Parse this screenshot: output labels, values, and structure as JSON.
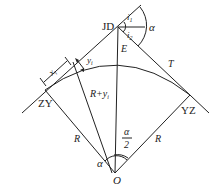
{
  "diagram": {
    "points": {
      "jd": "JD",
      "zy": "ZY",
      "yz": "YZ",
      "o": "O",
      "e": "E",
      "t": "T"
    },
    "labels": {
      "x_i": "x",
      "x_i_sub": "i",
      "y_i": "y",
      "y_i_sub": "i",
      "r_plus_y": "R+y",
      "r_plus_y_sub": "i",
      "r_left": "R",
      "r_right": "R",
      "alpha_top": "α",
      "alpha_bottom": "α",
      "half_alpha_num": "α",
      "half_alpha_den": "2",
      "i1": "i",
      "i1_sub": "1",
      "i2": "i",
      "i2_sub": "2"
    },
    "colors": {
      "stroke": "#222222",
      "background": "#ffffff"
    }
  }
}
